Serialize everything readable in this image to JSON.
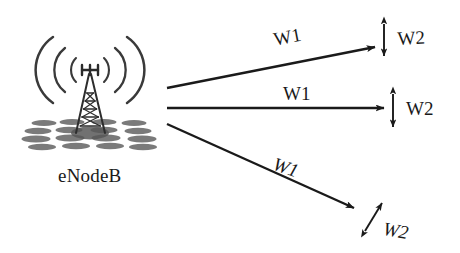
{
  "figure": {
    "type": "network-diagram",
    "background_color": "#ffffff",
    "stroke_color": "#1a1a1a",
    "ground_color": "#6e6e6e",
    "station": {
      "icon_name": "cell-tower-icon",
      "label": "eNodeB",
      "wave_arc_pairs": 3
    },
    "links": [
      {
        "id": "link-top",
        "beam_label": "W1",
        "spacing_label": "W2",
        "direction": "up-right",
        "beam_label_italic": false,
        "spacing_arrow": "vertical-double"
      },
      {
        "id": "link-middle",
        "beam_label": "W1",
        "spacing_label": "W2",
        "direction": "horizontal",
        "beam_label_italic": false,
        "spacing_arrow": "vertical-double"
      },
      {
        "id": "link-bottom",
        "beam_label": "W1",
        "spacing_label": "W2",
        "direction": "down-right",
        "beam_label_italic": true,
        "spacing_arrow": "diagonal-double"
      }
    ]
  }
}
